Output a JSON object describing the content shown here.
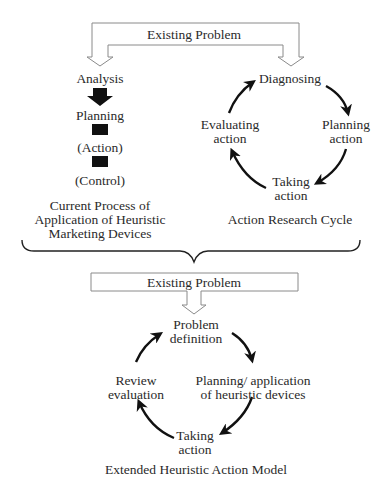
{
  "top_section": {
    "existing_problem_label": "Existing Problem",
    "current_process": {
      "steps": [
        "Analysis",
        "Planning",
        "(Action)",
        "(Control)"
      ],
      "caption_lines": [
        "Current Process of",
        "Application of Heuristic",
        "Marketing Devices"
      ]
    },
    "action_research_cycle": {
      "nodes": {
        "top": "Diagnosing",
        "right_line1": "Planning",
        "right_line2": "action",
        "bottom_line1": "Taking",
        "bottom_line2": "action",
        "left_line1": "Evaluating",
        "left_line2": "action"
      },
      "caption": "Action Research Cycle"
    }
  },
  "bottom_section": {
    "existing_problem_label": "Existing Problem",
    "extended_model": {
      "nodes": {
        "top_line1": "Problem",
        "top_line2": "definition",
        "right_line1": "Planning/ application",
        "right_line2": "of heuristic devices",
        "bottom_line1": "Taking",
        "bottom_line2": "action",
        "left_line1": "Review",
        "left_line2": "evaluation"
      },
      "caption": "Extended Heuristic Action Model"
    }
  },
  "colors": {
    "outline": "#8a8a8a",
    "arrow_fill": "#111111",
    "text": "#2a2a2a"
  }
}
